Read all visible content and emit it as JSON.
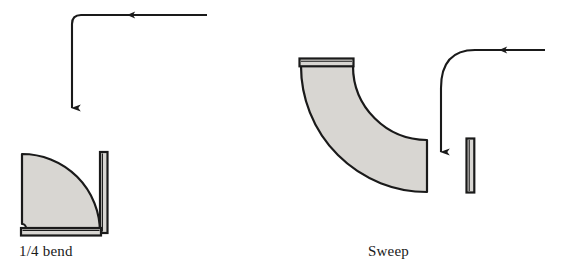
{
  "figure": {
    "background_color": "#ffffff",
    "ink_color": "#1a1a1a",
    "fitting_fill_color": "#d8d6d2",
    "fitting_stroke_color": "#1a1a1a"
  },
  "fittings": [
    {
      "key": "quarter_bend",
      "label": "1/4 bend",
      "icon_name": "quarter-bend-fitting",
      "turn_degrees": 90,
      "bend_style": "short-radius",
      "inner_radius_px": 4,
      "outer_radius_px": 78,
      "flange_count": 2
    },
    {
      "key": "sweep",
      "label": "Sweep",
      "icon_name": "sweep-fitting",
      "turn_degrees": 90,
      "bend_style": "long-radius",
      "inner_radius_px": 74,
      "outer_radius_px": 126,
      "flange_count": 2
    }
  ],
  "flow_arrows": [
    {
      "key": "sharp_turn_arrow",
      "icon_name": "sharp-right-angle-flow-arrow",
      "describes": "quarter_bend",
      "corner_radius_px": 9,
      "direction_in": "leftward",
      "direction_out": "downward",
      "arrowhead_count": 2
    },
    {
      "key": "gradual_turn_arrow",
      "icon_name": "gradual-curve-flow-arrow",
      "describes": "sweep",
      "corner_radius_px": 56,
      "direction_in": "leftward",
      "direction_out": "downward",
      "arrowhead_count": 2
    }
  ]
}
